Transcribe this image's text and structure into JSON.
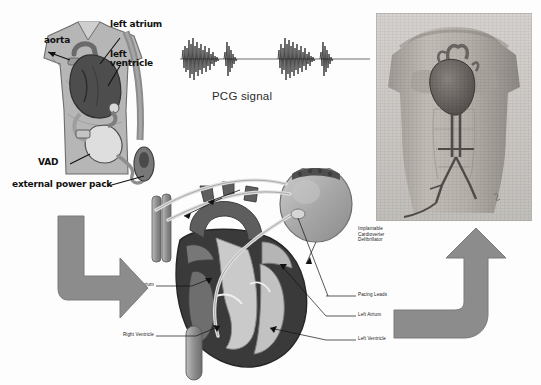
{
  "figure": {
    "background_color": "#fdfdfd",
    "ink_color": "#1a1a1a"
  },
  "vad_panel": {
    "name": "ventricular-assist-device-illustration",
    "labels": {
      "aorta": "aorta",
      "left_atrium": "left atrium",
      "left_ventricle": "left\nventricle",
      "vad": "VAD",
      "external_power_pack": "external power pack"
    },
    "colors": {
      "body": "#b9b9b9",
      "heart": "#4a4a4a",
      "pump": "#d9d9d9",
      "cable": "#8a8a8a"
    }
  },
  "pcg_panel": {
    "name": "phonocardiogram-signal",
    "caption": "PCG signal",
    "signal": {
      "type": "line",
      "description": "two cardiac cycles of heart sounds",
      "baseline_color": "#3a3a3a",
      "components": [
        "S1",
        "S2",
        "S1",
        "S2"
      ]
    }
  },
  "torso_panel": {
    "name": "anatomical-torso-photograph",
    "subject": "human male torso with heart and great vessels",
    "colors": {
      "skin": "#b5b0ab",
      "heart": "#6e6a67",
      "vessel": "#5c5854",
      "frame": "#cfcfcf"
    }
  },
  "heart_panel": {
    "name": "heart-cross-section-with-icd",
    "labels_right": [
      "Implantable\nCardioverter\nDefibrillator",
      "Pacing Leads",
      "Left Atrium",
      "Left Ventricle"
    ],
    "labels_left": [
      "Right Atrium",
      "Right Ventricle"
    ],
    "device": {
      "name": "implantable-cardioverter-defibrillator",
      "shape": "oval generator can"
    },
    "colors": {
      "myocardium": "#3b3b3b",
      "chamber_dark": "#5e5e5e",
      "chamber_light": "#c9c9c9",
      "vessel": "#8f8f8f",
      "lead": "#d6d6d6"
    }
  },
  "arrows": {
    "left": {
      "name": "flow-arrow-down-right",
      "direction": "down-then-right",
      "color": "#8a8a8a"
    },
    "right": {
      "name": "flow-arrow-left-up",
      "direction": "left-then-up",
      "color": "#8a8a8a"
    }
  }
}
